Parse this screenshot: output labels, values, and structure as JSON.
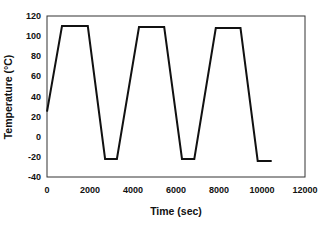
{
  "chart_data": {
    "type": "line",
    "title": "",
    "xlabel": "Time (sec)",
    "ylabel": "Temperature (°C)",
    "xlim": [
      0,
      12000
    ],
    "ylim": [
      -40,
      120
    ],
    "xticks": [
      0,
      2000,
      4000,
      6000,
      8000,
      10000,
      12000
    ],
    "yticks": [
      -40,
      -20,
      0,
      20,
      40,
      60,
      80,
      100,
      120
    ],
    "grid": false,
    "legend": null,
    "series": [
      {
        "name": "Temperature profile",
        "color": "#111111",
        "x": [
          0,
          700,
          1900,
          2700,
          3250,
          4280,
          5450,
          6280,
          6850,
          7850,
          9000,
          9800,
          10450
        ],
        "y": [
          25,
          110,
          110,
          -22,
          -22,
          109,
          109,
          -22,
          -22,
          108,
          108,
          -24,
          -24
        ]
      }
    ]
  }
}
